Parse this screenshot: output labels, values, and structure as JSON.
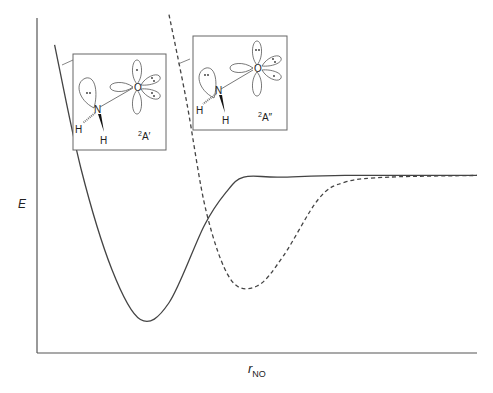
{
  "chart_data": {
    "type": "line",
    "title": "",
    "xlabel": "r",
    "xlabel_sub": "NO",
    "ylabel": "E",
    "grid": false,
    "series": [
      {
        "name": "2A'",
        "style": "solid",
        "color": "#444444",
        "points": [
          [
            0.04,
            0.92
          ],
          [
            0.1,
            0.55
          ],
          [
            0.17,
            0.25
          ],
          [
            0.235,
            0.1
          ],
          [
            0.3,
            0.15
          ],
          [
            0.38,
            0.38
          ],
          [
            0.43,
            0.48
          ],
          [
            0.47,
            0.525
          ],
          [
            0.55,
            0.525
          ],
          [
            0.7,
            0.53
          ],
          [
            1.0,
            0.53
          ]
        ]
      },
      {
        "name": "2A''",
        "style": "dashed",
        "color": "#444444",
        "points": [
          [
            0.3,
            1.01
          ],
          [
            0.34,
            0.75
          ],
          [
            0.385,
            0.42
          ],
          [
            0.44,
            0.22
          ],
          [
            0.5,
            0.2
          ],
          [
            0.56,
            0.29
          ],
          [
            0.64,
            0.46
          ],
          [
            0.7,
            0.51
          ],
          [
            0.8,
            0.525
          ],
          [
            1.0,
            0.53
          ]
        ]
      }
    ],
    "annotations": [
      {
        "label": "2A'",
        "superscript": "2",
        "term": "A'",
        "atoms": [
          "N",
          "O",
          "H",
          "H"
        ]
      },
      {
        "label": "2A''",
        "superscript": "2",
        "term": "A''",
        "atoms": [
          "N",
          "O",
          "H",
          "H"
        ]
      }
    ]
  },
  "insets": [
    {
      "state_sup": "2",
      "state": "A′",
      "n": "N",
      "o": "O",
      "h1": "H",
      "h2": "H"
    },
    {
      "state_sup": "2",
      "state": "A″",
      "n": "N",
      "o": "O",
      "h1": "H",
      "h2": "H"
    }
  ],
  "axes": {
    "y_label": "E",
    "x_label": "r",
    "x_label_sub": "NO"
  }
}
